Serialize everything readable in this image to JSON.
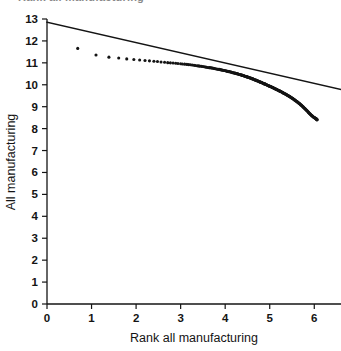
{
  "figure": {
    "clipped_header": "Rank all manufacturing",
    "background_color": "#ffffff",
    "ink_color": "#141414"
  },
  "chart_data": {
    "type": "scatter",
    "title": "",
    "xlabel": "Rank all manufacturing",
    "ylabel": "All manufacturing",
    "xlim": [
      0,
      6.6
    ],
    "ylim": [
      0,
      13
    ],
    "xticks": [
      0,
      1,
      2,
      3,
      4,
      5,
      6
    ],
    "yticks": [
      0,
      1,
      2,
      3,
      4,
      5,
      6,
      7,
      8,
      9,
      10,
      11,
      12,
      13
    ],
    "xtick_labels": [
      "0",
      "1",
      "2",
      "3",
      "4",
      "5",
      "6"
    ],
    "ytick_labels": [
      "0",
      "1",
      "2",
      "3",
      "4",
      "5",
      "6",
      "7",
      "8",
      "9",
      "10",
      "11",
      "12",
      "13"
    ],
    "grid": false,
    "legend": false,
    "marker": "filled-circle",
    "marker_color": "#141414",
    "line_color": "#141414",
    "series": [
      {
        "name": "Observed rank-size points",
        "type": "scatter",
        "x": [
          0.69,
          1.1,
          1.39,
          1.61,
          1.79,
          1.95,
          2.08,
          2.2,
          2.3,
          2.4,
          2.48,
          2.56,
          2.64,
          2.71,
          2.77,
          2.83,
          2.89,
          2.94,
          3.0,
          3.04,
          3.09,
          3.14,
          3.18,
          3.22,
          3.26,
          3.3,
          3.33,
          3.37,
          3.4,
          3.43,
          3.47,
          3.5,
          3.53,
          3.56,
          3.58,
          3.61,
          3.64,
          3.66,
          3.69,
          3.71,
          3.74,
          3.76,
          3.78,
          3.81,
          3.83,
          3.85,
          3.87,
          3.89,
          3.91,
          3.93,
          3.95,
          3.97,
          3.99,
          4.01,
          4.03,
          4.04,
          4.06,
          4.08,
          4.09,
          4.11,
          4.13,
          4.14,
          4.16,
          4.17,
          4.19,
          4.2,
          4.22,
          4.23,
          4.25,
          4.26,
          4.28,
          4.29,
          4.3,
          4.32,
          4.33,
          4.34,
          4.36,
          4.37,
          4.38,
          4.39,
          4.41,
          4.42,
          4.43,
          4.44,
          4.45,
          4.47,
          4.48,
          4.49,
          4.5,
          4.51,
          4.52,
          4.54,
          4.55,
          4.56,
          4.57,
          4.58,
          4.59,
          4.6,
          4.61,
          4.62,
          4.63,
          4.64,
          4.65,
          4.66,
          4.67,
          4.68,
          4.69,
          4.7,
          4.71,
          4.72,
          4.73,
          4.74,
          4.75,
          4.76,
          4.77,
          4.78,
          4.79,
          4.8,
          4.81,
          4.82,
          4.83,
          4.84,
          4.85,
          4.86,
          4.87,
          4.88,
          4.89,
          4.9,
          4.91,
          4.92,
          4.93,
          4.94,
          4.95,
          4.96,
          4.97,
          4.98,
          4.99,
          5.0,
          5.01,
          5.02,
          5.03,
          5.04,
          5.05,
          5.06,
          5.07,
          5.08,
          5.09,
          5.1,
          5.11,
          5.12,
          5.13,
          5.14,
          5.15,
          5.16,
          5.17,
          5.18,
          5.19,
          5.2,
          5.21,
          5.22,
          5.23,
          5.24,
          5.25,
          5.26,
          5.27,
          5.28,
          5.29,
          5.3,
          5.31,
          5.32,
          5.33,
          5.34,
          5.35,
          5.36,
          5.37,
          5.38,
          5.39,
          5.4,
          5.41,
          5.42,
          5.43,
          5.44,
          5.45,
          5.46,
          5.47,
          5.48,
          5.49,
          5.5,
          5.51,
          5.52,
          5.53,
          5.54,
          5.55,
          5.56,
          5.57,
          5.58,
          5.59,
          5.6,
          5.61,
          5.62,
          5.63,
          5.64,
          5.65,
          5.66,
          5.67,
          5.68,
          5.69,
          5.7,
          5.71,
          5.72,
          5.73,
          5.74,
          5.75,
          5.76,
          5.77,
          5.78,
          5.79,
          5.8,
          5.81,
          5.82,
          5.83,
          5.84,
          5.85,
          5.86,
          5.87,
          5.88,
          5.89,
          5.9,
          5.91,
          5.92,
          5.93,
          5.94,
          5.95,
          5.96,
          5.97,
          5.98,
          5.99,
          6.0,
          6.01,
          6.02,
          6.03,
          6.04,
          6.04,
          6.05,
          6.05,
          6.06,
          6.06,
          6.06
        ],
        "y": [
          11.66,
          11.36,
          11.26,
          11.22,
          11.18,
          11.15,
          11.13,
          11.11,
          11.09,
          11.07,
          11.06,
          11.04,
          11.03,
          11.01,
          11.0,
          10.99,
          10.98,
          10.97,
          10.96,
          10.95,
          10.94,
          10.93,
          10.92,
          10.91,
          10.9,
          10.89,
          10.88,
          10.87,
          10.86,
          10.85,
          10.84,
          10.83,
          10.82,
          10.81,
          10.8,
          10.79,
          10.78,
          10.78,
          10.77,
          10.76,
          10.75,
          10.74,
          10.73,
          10.72,
          10.71,
          10.71,
          10.7,
          10.69,
          10.68,
          10.67,
          10.66,
          10.65,
          10.65,
          10.64,
          10.63,
          10.62,
          10.61,
          10.6,
          10.6,
          10.59,
          10.58,
          10.57,
          10.56,
          10.55,
          10.55,
          10.54,
          10.53,
          10.52,
          10.51,
          10.51,
          10.5,
          10.49,
          10.48,
          10.47,
          10.47,
          10.46,
          10.45,
          10.44,
          10.43,
          10.43,
          10.42,
          10.41,
          10.4,
          10.39,
          10.39,
          10.38,
          10.37,
          10.36,
          10.35,
          10.35,
          10.34,
          10.33,
          10.32,
          10.31,
          10.31,
          10.3,
          10.29,
          10.28,
          10.27,
          10.27,
          10.26,
          10.25,
          10.24,
          10.23,
          10.22,
          10.22,
          10.21,
          10.2,
          10.19,
          10.18,
          10.17,
          10.17,
          10.16,
          10.15,
          10.14,
          10.13,
          10.12,
          10.11,
          10.11,
          10.1,
          10.09,
          10.08,
          10.07,
          10.06,
          10.05,
          10.04,
          10.04,
          10.03,
          10.02,
          10.01,
          10.0,
          9.99,
          9.98,
          9.97,
          9.96,
          9.95,
          9.94,
          9.93,
          9.93,
          9.92,
          9.91,
          9.9,
          9.89,
          9.88,
          9.87,
          9.86,
          9.85,
          9.84,
          9.83,
          9.82,
          9.81,
          9.8,
          9.79,
          9.78,
          9.77,
          9.76,
          9.75,
          9.74,
          9.73,
          9.72,
          9.71,
          9.7,
          9.69,
          9.68,
          9.67,
          9.66,
          9.65,
          9.63,
          9.62,
          9.61,
          9.6,
          9.59,
          9.58,
          9.57,
          9.56,
          9.54,
          9.53,
          9.52,
          9.51,
          9.5,
          9.48,
          9.47,
          9.46,
          9.45,
          9.43,
          9.42,
          9.41,
          9.39,
          9.38,
          9.37,
          9.35,
          9.34,
          9.32,
          9.31,
          9.29,
          9.28,
          9.26,
          9.25,
          9.23,
          9.22,
          9.2,
          9.19,
          9.17,
          9.15,
          9.14,
          9.12,
          9.1,
          9.08,
          9.07,
          9.05,
          9.03,
          9.01,
          8.99,
          8.97,
          8.95,
          8.93,
          8.91,
          8.89,
          8.87,
          8.85,
          8.83,
          8.81,
          8.79,
          8.77,
          8.74,
          8.72,
          8.7,
          8.68,
          8.66,
          8.64,
          8.62,
          8.6,
          8.58,
          8.57,
          8.55,
          8.53,
          8.52,
          8.5,
          8.49,
          8.48,
          8.47,
          8.46,
          8.45,
          8.44,
          8.43,
          8.42,
          8.41,
          8.4
        ]
      },
      {
        "name": "Fitted regression line",
        "type": "line",
        "x": [
          0.0,
          6.6
        ],
        "y": [
          12.85,
          9.78
        ]
      }
    ]
  }
}
